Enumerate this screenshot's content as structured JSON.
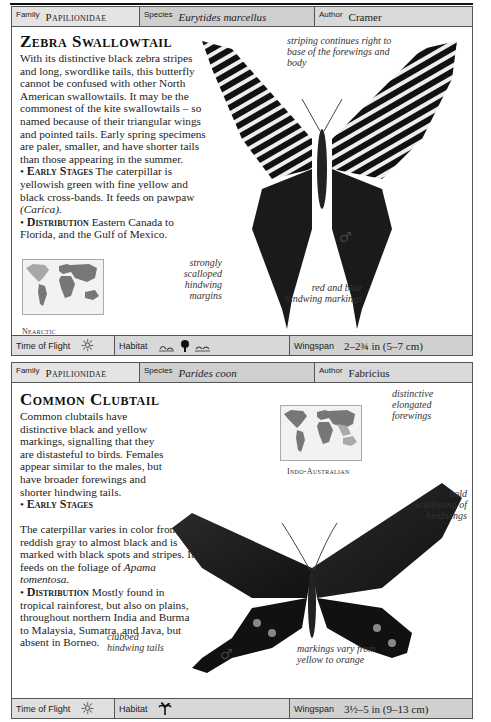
{
  "cards": [
    {
      "header": {
        "family_label": "Family",
        "family": "Papilionidae",
        "species_label": "Species",
        "species": "Eurytides marcellus",
        "author_label": "Author",
        "author": "Cramer"
      },
      "title": "Zebra Swallowtail",
      "intro": "With its distinctive black zebra stripes and long, swordlike tails, this butterfly cannot be confused with other North American swallowtails. It may be the commonest of the kite swallowtails – so named because of their triangular wings and pointed tails. Early spring specimens are paler, smaller, and have shorter tails than those appearing in the summer.",
      "early_stages_heading": "Early Stages",
      "early_stages_text": "The caterpillar is yellowish green with fine yellow and black cross-bands. It feeds on pawpaw ",
      "early_stages_host": "(Carica).",
      "distribution_heading": "Distribution",
      "distribution_text": "Eastern Canada to Florida, and the Gulf of Mexico.",
      "region": "Nearctic",
      "annotations": {
        "a1": "striping continues right to base of the forewings and body",
        "a2": "strongly scalloped hindwing margins",
        "a3": "red and blue hindwing markings"
      },
      "sex_symbol": "♂",
      "footer": {
        "time_label": "Time of Flight",
        "time_icon": "☼",
        "habitat_label": "Habitat",
        "habitat_icons": [
          "wetland-icon",
          "tree-icon",
          "wetland-icon"
        ],
        "wingspan_label": "Wingspan",
        "wingspan": "2–2¾ in (5–7 cm)"
      }
    },
    {
      "header": {
        "family_label": "Family",
        "family": "Papilionidae",
        "species_label": "Species",
        "species": "Parides coon",
        "author_label": "Author",
        "author": "Fabricius"
      },
      "title": "Common Clubtail",
      "intro": "Common clubtails have distinctive black and yellow markings, signalling that they are distasteful to birds. Females appear similar to the males, but have broader forewings and shorter hindwing tails.",
      "early_stages_heading": "Early Stages",
      "early_stages_text": "The caterpillar varies in color from reddish gray to almost black and is marked with black spots and stripes. It feeds on the foliage of ",
      "early_stages_host": "Apama tomentosa.",
      "distribution_heading": "Distribution",
      "distribution_text": "Mostly found in tropical rainforest, but also on plains, throughout northern India and Burma to Malaysia, Sumatra, and Java, but absent in Borneo.",
      "region": "Indo-Australian",
      "annotations": {
        "a1": "distinctive elongated forewings",
        "a2": "bold scalloping of hindwings",
        "a3": "clubbed hindwing tails",
        "a4": "markings vary from yellow to orange"
      },
      "sex_symbol": "♂",
      "footer": {
        "time_label": "Time of Flight",
        "time_icon": "☼",
        "habitat_label": "Habitat",
        "habitat_icons": [
          "palm-tree-icon"
        ],
        "wingspan_label": "Wingspan",
        "wingspan": "3½–5 in (9–13 cm)"
      }
    }
  ],
  "colors": {
    "header_bg": "#d6d6d6",
    "border": "#555555",
    "text": "#1a1a1a"
  }
}
